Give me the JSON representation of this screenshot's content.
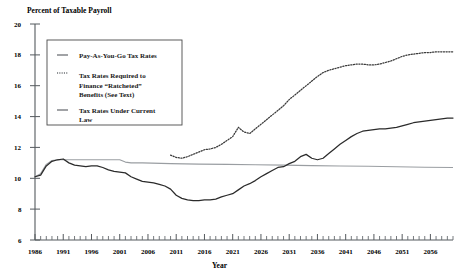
{
  "chart_data": {
    "type": "line",
    "title": "",
    "ylabel": "Percent of Taxable Payroll",
    "xlabel": "Year",
    "ylim": [
      6,
      20
    ],
    "xlim": [
      1986,
      2060
    ],
    "grid": false,
    "legend_position": "upper-left-inset",
    "y_ticks": [
      6,
      8,
      10,
      12,
      14,
      16,
      18,
      20
    ],
    "x_ticks": [
      1986,
      1991,
      1996,
      2001,
      2006,
      2011,
      2016,
      2021,
      2026,
      2031,
      2036,
      2041,
      2046,
      2051,
      2056
    ],
    "x_minor_tick_step": 1,
    "series": [
      {
        "name": "Pay-As-You-Go Tax Rates",
        "style": "solid",
        "color": "#2b2b2b",
        "x": [
          1986,
          1987,
          1988,
          1989,
          1990,
          1991,
          1992,
          1993,
          1994,
          1995,
          1996,
          1997,
          1998,
          1999,
          2000,
          2001,
          2002,
          2003,
          2004,
          2005,
          2006,
          2007,
          2008,
          2009,
          2010,
          2011,
          2012,
          2013,
          2014,
          2015,
          2016,
          2017,
          2018,
          2019,
          2020,
          2021,
          2022,
          2023,
          2024,
          2025,
          2026,
          2027,
          2028,
          2029,
          2030,
          2031,
          2032,
          2033,
          2034,
          2035,
          2036,
          2037,
          2038,
          2039,
          2040,
          2041,
          2042,
          2043,
          2044,
          2045,
          2046,
          2047,
          2048,
          2049,
          2050,
          2051,
          2052,
          2053,
          2054,
          2055,
          2056,
          2057,
          2058,
          2059,
          2060
        ],
        "values": [
          10.1,
          10.2,
          10.8,
          11.1,
          11.2,
          11.25,
          11.0,
          10.85,
          10.8,
          10.75,
          10.8,
          10.8,
          10.7,
          10.55,
          10.45,
          10.4,
          10.35,
          10.1,
          9.95,
          9.8,
          9.75,
          9.7,
          9.6,
          9.5,
          9.3,
          8.9,
          8.7,
          8.6,
          8.55,
          8.55,
          8.6,
          8.6,
          8.65,
          8.8,
          8.9,
          9.0,
          9.25,
          9.5,
          9.65,
          9.85,
          10.1,
          10.3,
          10.5,
          10.7,
          10.75,
          10.95,
          11.1,
          11.4,
          11.55,
          11.3,
          11.2,
          11.3,
          11.6,
          11.9,
          12.2,
          12.45,
          12.7,
          12.9,
          13.05,
          13.1,
          13.15,
          13.2,
          13.2,
          13.25,
          13.3,
          13.4,
          13.5,
          13.6,
          13.65,
          13.7,
          13.75,
          13.8,
          13.85,
          13.9,
          13.9
        ]
      },
      {
        "name": "Tax Rates Required to Finance \"Ratcheted\" Benefits (See Text)",
        "style": "dotted",
        "color": "#3a3a3a",
        "x": [
          2010,
          2011,
          2012,
          2013,
          2014,
          2015,
          2016,
          2017,
          2018,
          2019,
          2020,
          2021,
          2022,
          2023,
          2024,
          2025,
          2026,
          2027,
          2028,
          2029,
          2030,
          2031,
          2032,
          2033,
          2034,
          2035,
          2036,
          2037,
          2038,
          2039,
          2040,
          2041,
          2042,
          2043,
          2044,
          2045,
          2046,
          2047,
          2048,
          2049,
          2050,
          2051,
          2052,
          2053,
          2054,
          2055,
          2056,
          2057,
          2058,
          2059,
          2060
        ],
        "values": [
          11.5,
          11.35,
          11.3,
          11.4,
          11.55,
          11.7,
          11.85,
          11.9,
          12.0,
          12.2,
          12.45,
          12.7,
          13.3,
          13.0,
          12.9,
          13.2,
          13.5,
          13.8,
          14.1,
          14.4,
          14.7,
          15.1,
          15.4,
          15.7,
          16.0,
          16.3,
          16.6,
          16.85,
          17.0,
          17.1,
          17.2,
          17.3,
          17.35,
          17.4,
          17.4,
          17.35,
          17.35,
          17.4,
          17.5,
          17.6,
          17.75,
          17.9,
          18.0,
          18.05,
          18.1,
          18.15,
          18.15,
          18.2,
          18.2,
          18.2,
          18.2
        ]
      },
      {
        "name": "Tax Rates Under Current Law",
        "style": "solid-light",
        "color": "#9a9ea2",
        "x": [
          1986,
          1987,
          1988,
          1989,
          1990,
          1991,
          1992,
          1993,
          1994,
          1995,
          1996,
          1997,
          1998,
          1999,
          2000,
          2001,
          2002,
          2003,
          2004,
          2005,
          2010,
          2015,
          2020,
          2025,
          2030,
          2035,
          2040,
          2045,
          2050,
          2055,
          2060
        ],
        "values": [
          10.1,
          10.3,
          10.9,
          11.15,
          11.2,
          11.2,
          11.2,
          11.2,
          11.2,
          11.2,
          11.2,
          11.2,
          11.2,
          11.2,
          11.2,
          11.2,
          11.05,
          11.0,
          11.0,
          11.0,
          10.95,
          10.92,
          10.9,
          10.88,
          10.85,
          10.82,
          10.8,
          10.78,
          10.75,
          10.72,
          10.7
        ]
      }
    ]
  },
  "legend": {
    "items": [
      {
        "label": "Pay-As-You-Go Tax Rates",
        "style": "solid"
      },
      {
        "label": "Tax Rates Required to",
        "label2": "Finance “Ratcheted”",
        "label3": "Benefits (See Text)",
        "style": "dotted"
      },
      {
        "label": "Tax Rates Under Current",
        "label2": "Law",
        "style": "solid"
      }
    ]
  },
  "labels": {
    "y_axis_title": "Percent of Taxable Payroll",
    "x_axis_title": "Year",
    "y_tick_20": "20",
    "y_tick_18": "18",
    "y_tick_16": "16",
    "y_tick_14": "14",
    "y_tick_12": "12",
    "y_tick_10": "10",
    "y_tick_8": "8",
    "y_tick_6": "6",
    "x_tick_1986": "1986",
    "x_tick_1991": "1991",
    "x_tick_1996": "1996",
    "x_tick_2001": "2001",
    "x_tick_2006": "2006",
    "x_tick_2011": "2011",
    "x_tick_2016": "2016",
    "x_tick_2021": "2021",
    "x_tick_2026": "2026",
    "x_tick_2031": "2031",
    "x_tick_2036": "2036",
    "x_tick_2041": "2041",
    "x_tick_2046": "2046",
    "x_tick_2051": "2051",
    "x_tick_2056": "2056"
  }
}
